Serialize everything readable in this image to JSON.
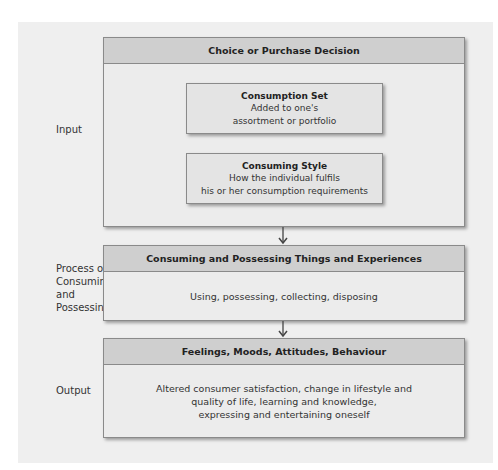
{
  "labels": {
    "input": "Input",
    "process": [
      "Process of",
      "Consuming",
      "and",
      "Possessing"
    ],
    "output": "Output"
  },
  "input_box": {
    "header": "Choice or Purchase Decision",
    "consumption_set": {
      "title": "Consumption Set",
      "lines": [
        "Added to one's",
        "assortment or portfolio"
      ]
    },
    "consuming_style": {
      "title": "Consuming Style",
      "lines": [
        "How the individual fulfils",
        "his or her consumption requirements"
      ]
    }
  },
  "process_box": {
    "header": "Consuming and Possessing Things and Experiences",
    "body": "Using, possessing, collecting, disposing"
  },
  "output_box": {
    "header": "Feelings, Moods, Attitudes, Behaviour",
    "lines": [
      "Altered consumer satisfaction, change in lifestyle and",
      "quality of life, learning and knowledge,",
      "expressing and entertaining oneself"
    ]
  },
  "colors": {
    "panel_bg": "#efefef",
    "header_bg": "#cfcfcf",
    "box_bg": "#ececec",
    "border": "#8a8a8a"
  }
}
